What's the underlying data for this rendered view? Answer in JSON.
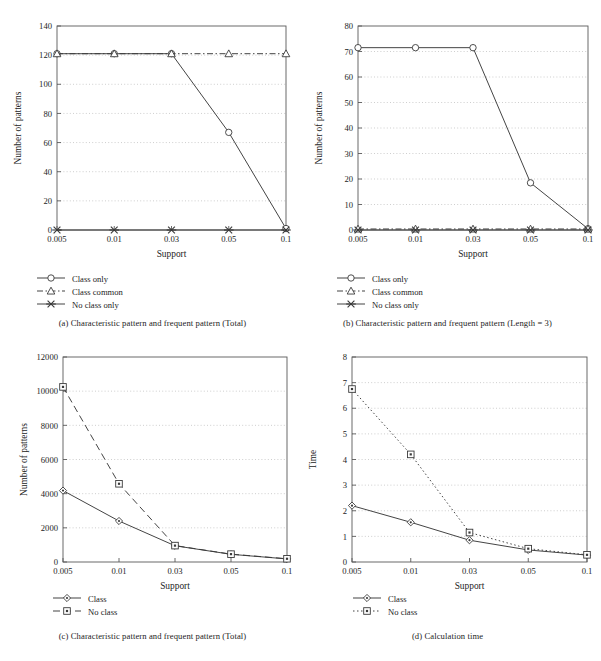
{
  "figure": {
    "background": "#ffffff",
    "line_color": "#3a3a3a",
    "grid_color": "#b9b9b9"
  },
  "panels": [
    {
      "id": "a",
      "caption": "(a)  Characteristic pattern and frequent pattern (Total)",
      "legend": [
        {
          "label": "Class only",
          "marker": "circle",
          "dash": "solid"
        },
        {
          "label": "Class common",
          "marker": "triangle",
          "dash": "dashdot"
        },
        {
          "label": "No class only",
          "marker": "cross",
          "dash": "solid"
        }
      ]
    },
    {
      "id": "b",
      "caption": "(b)  Characteristic pattern and frequent pattern (Length = 3)",
      "legend": [
        {
          "label": "Class only",
          "marker": "circle",
          "dash": "solid"
        },
        {
          "label": "Class common",
          "marker": "triangle",
          "dash": "dashdot"
        },
        {
          "label": "No class only",
          "marker": "cross",
          "dash": "solid"
        }
      ]
    },
    {
      "id": "c",
      "caption": "(c)  Characteristic pattern and frequent pattern (Total)",
      "legend": [
        {
          "label": "Class",
          "marker": "diamond",
          "dash": "solid"
        },
        {
          "label": "No class",
          "marker": "square",
          "dash": "dashed"
        }
      ]
    },
    {
      "id": "d",
      "caption": "(d)  Calculation time",
      "legend": [
        {
          "label": "Class",
          "marker": "diamond",
          "dash": "solid"
        },
        {
          "label": "No class",
          "marker": "square",
          "dash": "dotted"
        }
      ]
    }
  ],
  "chart_data": [
    {
      "id": "a",
      "type": "line",
      "title": "",
      "xlabel": "Support",
      "ylabel": "Number of patterns",
      "categories": [
        "0.005",
        "0.01",
        "0.03",
        "0.05",
        "0.1"
      ],
      "x": [
        0.005,
        0.01,
        0.03,
        0.05,
        0.1
      ],
      "ylim": [
        0,
        140
      ],
      "yticks": [
        0,
        20,
        40,
        60,
        80,
        100,
        120,
        140
      ],
      "grid": true,
      "legend_position": "below",
      "series": [
        {
          "name": "Class only",
          "marker": "circle",
          "dash": "solid",
          "values": [
            121,
            121,
            121,
            67,
            1
          ]
        },
        {
          "name": "Class common",
          "marker": "triangle",
          "dash": "dashdot",
          "values": [
            121,
            121,
            121,
            121,
            121
          ]
        },
        {
          "name": "No class only",
          "marker": "cross",
          "dash": "solid",
          "values": [
            0,
            0,
            0,
            0,
            0
          ]
        }
      ]
    },
    {
      "id": "b",
      "type": "line",
      "title": "",
      "xlabel": "Support",
      "ylabel": "Number of patterns",
      "categories": [
        "0.005",
        "0.01",
        "0.03",
        "0.05",
        "0.1"
      ],
      "x": [
        0.005,
        0.01,
        0.03,
        0.05,
        0.1
      ],
      "ylim": [
        0,
        80
      ],
      "yticks": [
        0,
        10,
        20,
        30,
        40,
        50,
        60,
        70,
        80
      ],
      "grid": true,
      "legend_position": "below",
      "series": [
        {
          "name": "Class only",
          "marker": "circle",
          "dash": "solid",
          "values": [
            71.5,
            71.5,
            71.5,
            18.5,
            0.5
          ]
        },
        {
          "name": "Class common",
          "marker": "triangle",
          "dash": "dashdot",
          "values": [
            0.4,
            0.4,
            0.4,
            0.4,
            0.4
          ]
        },
        {
          "name": "No class only",
          "marker": "cross",
          "dash": "solid",
          "values": [
            0,
            0,
            0,
            0,
            0
          ]
        }
      ]
    },
    {
      "id": "c",
      "type": "line",
      "title": "",
      "xlabel": "Support",
      "ylabel": "Number of patterns",
      "categories": [
        "0.005",
        "0.01",
        "0.03",
        "0.05",
        "0.1"
      ],
      "x": [
        0.005,
        0.01,
        0.03,
        0.05,
        0.1
      ],
      "ylim": [
        0,
        12000
      ],
      "yticks": [
        0,
        2000,
        4000,
        6000,
        8000,
        10000,
        12000
      ],
      "grid": true,
      "legend_position": "below",
      "series": [
        {
          "name": "Class",
          "marker": "diamond",
          "dash": "solid",
          "values": [
            4180,
            2400,
            950,
            450,
            180
          ]
        },
        {
          "name": "No class",
          "marker": "square",
          "dash": "dashed",
          "values": [
            10250,
            4580,
            960,
            460,
            190
          ]
        }
      ]
    },
    {
      "id": "d",
      "type": "line",
      "title": "",
      "xlabel": "Support",
      "ylabel": "Time",
      "categories": [
        "0.005",
        "0.01",
        "0.03",
        "0.05",
        "0.1"
      ],
      "x": [
        0.005,
        0.01,
        0.03,
        0.05,
        0.1
      ],
      "ylim": [
        0,
        8
      ],
      "yticks": [
        0,
        1,
        2,
        3,
        4,
        5,
        6,
        7,
        8
      ],
      "grid": true,
      "legend_position": "below",
      "series": [
        {
          "name": "Class",
          "marker": "diamond",
          "dash": "solid",
          "values": [
            2.2,
            1.55,
            0.85,
            0.47,
            0.27
          ]
        },
        {
          "name": "No class",
          "marker": "square",
          "dash": "dotted",
          "values": [
            6.75,
            4.2,
            1.15,
            0.52,
            0.28
          ]
        }
      ]
    }
  ]
}
